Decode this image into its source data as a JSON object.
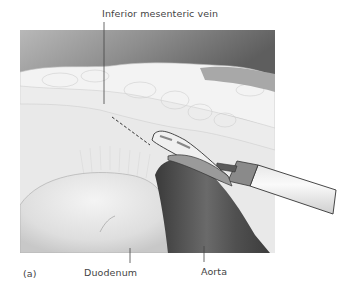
{
  "figure": {
    "panel_label": "(a)",
    "labels": {
      "inferior_mesenteric_vein": "Inferior mesenteric vein",
      "duodenum": "Duodenum",
      "aorta": "Aorta"
    },
    "colors": {
      "background": "#ffffff",
      "top_shade": "#7a7a7a",
      "fat_tissue": "#ededed",
      "aorta": "#4a4a4a",
      "duodenum": "#e4e4e4",
      "instrument": "#f2f2f2",
      "leader_line": "#444444"
    }
  }
}
